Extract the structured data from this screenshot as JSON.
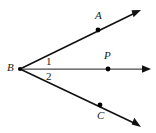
{
  "figure": {
    "background_color": "#ffffff",
    "stroke_color": "#111111",
    "middle_stroke_color": "#4a4a4a",
    "point_color": "#000000",
    "labels": {
      "vertex": "B",
      "point_a": "A",
      "point_p": "P",
      "point_c": "C",
      "angle_one": "1",
      "angle_two": "2"
    },
    "points": [
      {
        "name": "B",
        "x": 20,
        "y": 69,
        "dot": true
      },
      {
        "name": "A",
        "x": 98,
        "y": 30,
        "dot": true
      },
      {
        "name": "P",
        "x": 108,
        "y": 69,
        "dot": true
      },
      {
        "name": "C",
        "x": 100,
        "y": 105,
        "dot": true
      }
    ],
    "rays": [
      {
        "name": "ray-BA",
        "from": [
          20,
          69
        ],
        "to": [
          140,
          10
        ],
        "arrow": true
      },
      {
        "name": "ray-BP",
        "from": [
          20,
          69
        ],
        "to": [
          150,
          69
        ],
        "arrow": true
      },
      {
        "name": "ray-BC",
        "from": [
          20,
          69
        ],
        "to": [
          140,
          126
        ],
        "arrow": true
      }
    ]
  }
}
